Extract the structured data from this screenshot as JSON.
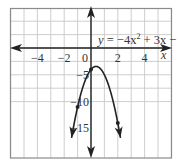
{
  "chart_data": {
    "type": "line",
    "title": "",
    "equation_label": {
      "y": "y",
      "eq": " = −4x",
      "sup": "2",
      "rest": " + 3x − 4"
    },
    "xlabel": "x",
    "ylabel": "",
    "xlim": [
      -6,
      6
    ],
    "ylim": [
      -19,
      6
    ],
    "grid": true,
    "x_ticks": [
      {
        "value": -4,
        "label": "−4"
      },
      {
        "value": -2,
        "label": "−2"
      },
      {
        "value": 0,
        "label": "0"
      },
      {
        "value": 2,
        "label": "2"
      },
      {
        "value": 4,
        "label": "4"
      }
    ],
    "y_ticks": [
      {
        "value": -5,
        "label": "−5"
      },
      {
        "value": -10,
        "label": "−10"
      },
      {
        "value": -15,
        "label": "−15"
      }
    ],
    "series": [
      {
        "name": "y = −4x² + 3x − 4",
        "function": {
          "a": -4,
          "b": 3,
          "c": -4
        },
        "x_range": [
          -1.45,
          2.2
        ],
        "marked_points": [
          {
            "x": -1,
            "y": -11
          },
          {
            "x": 0,
            "y": -4
          },
          {
            "x": 2,
            "y": -14
          }
        ]
      }
    ],
    "colors": {
      "grid": "#c8c8c8",
      "axis": "#222222",
      "curve": "#222222",
      "border": "#8a8a8a"
    }
  }
}
